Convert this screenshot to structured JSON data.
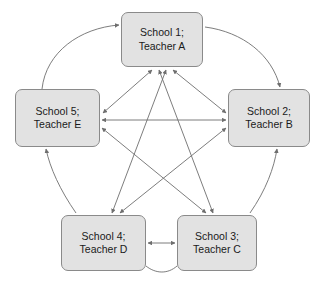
{
  "diagram": {
    "type": "network-graph",
    "layout": "pentagon",
    "node_fill_color": "#e2e2e2",
    "node_border_color": "#8a8a8a",
    "edge_color": "#6e6e6e",
    "background_color": "#ffffff",
    "nodes": [
      {
        "id": "school1",
        "line1": "School 1;",
        "line2": "Teacher A",
        "position": "top"
      },
      {
        "id": "school2",
        "line1": "School 2;",
        "line2": "Teacher B",
        "position": "right"
      },
      {
        "id": "school3",
        "line1": "School 3;",
        "line2": "Teacher C",
        "position": "bottom-right"
      },
      {
        "id": "school4",
        "line1": "School 4;",
        "line2": "Teacher D",
        "position": "bottom-left"
      },
      {
        "id": "school5",
        "line1": "School 5;",
        "line2": "Teacher E",
        "position": "left"
      }
    ],
    "edges": [
      {
        "from": "school5",
        "to": "school1",
        "style": "curved",
        "direction": "bidirectional"
      },
      {
        "from": "school1",
        "to": "school2",
        "style": "curved",
        "direction": "bidirectional"
      },
      {
        "from": "school2",
        "to": "school3",
        "style": "curved",
        "direction": "bidirectional"
      },
      {
        "from": "school3",
        "to": "school4",
        "style": "curved",
        "direction": "bidirectional"
      },
      {
        "from": "school4",
        "to": "school5",
        "style": "curved",
        "direction": "bidirectional"
      },
      {
        "from": "school5",
        "to": "school2",
        "style": "straight",
        "direction": "bidirectional"
      },
      {
        "from": "school4",
        "to": "school3",
        "style": "straight",
        "direction": "bidirectional"
      },
      {
        "from": "school1",
        "to": "school3",
        "style": "straight",
        "direction": "bidirectional"
      },
      {
        "from": "school1",
        "to": "school4",
        "style": "straight",
        "direction": "bidirectional"
      },
      {
        "from": "school5",
        "to": "school3",
        "style": "straight",
        "direction": "bidirectional"
      },
      {
        "from": "school2",
        "to": "school4",
        "style": "straight",
        "direction": "bidirectional"
      }
    ]
  }
}
